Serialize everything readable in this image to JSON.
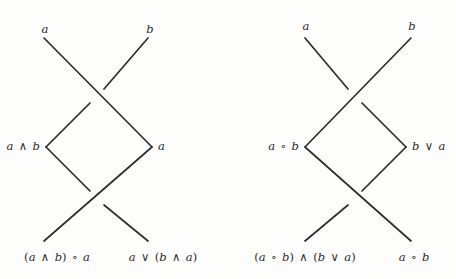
{
  "figure": {
    "type": "braid-diagram-pair",
    "background_color": "#fdfdfc",
    "stroke_color": "#2e2e2e",
    "stroke_width": 1.7,
    "width": 456,
    "height": 279
  },
  "diagrams": [
    {
      "id": "left-diagram",
      "name": "left-braid-diagram",
      "labels": {
        "top_left": "a",
        "top_right": "b",
        "middle_left": "a ∧ b",
        "middle_right": "a",
        "bottom_left": "(a ∧ b) ∘ a",
        "bottom_right": "a ∨ (b ∧ a)"
      },
      "crossings": [
        {
          "name": "upper-crossing",
          "over_strand": "nw-se",
          "under_strand": "sw-ne"
        },
        {
          "name": "lower-crossing",
          "over_strand": "sw-ne",
          "under_strand": "nw-se"
        }
      ]
    },
    {
      "id": "right-diagram",
      "name": "right-braid-diagram",
      "labels": {
        "top_left": "a",
        "top_right": "b",
        "middle_left": "a ∘ b",
        "middle_right": "b ∨ a",
        "bottom_left": "(a ∘ b) ∧ (b ∨ a)",
        "bottom_right": "a ∘ b"
      },
      "crossings": [
        {
          "name": "upper-crossing",
          "over_strand": "sw-ne",
          "under_strand": "nw-se"
        },
        {
          "name": "lower-crossing",
          "over_strand": "nw-se",
          "under_strand": "sw-ne"
        }
      ]
    }
  ]
}
